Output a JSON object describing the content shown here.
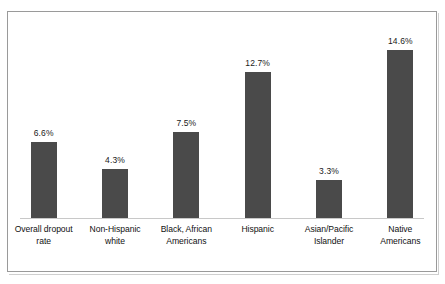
{
  "chart_data": {
    "type": "bar",
    "title": "",
    "subtitle": "",
    "xlabel": "",
    "ylabel": "",
    "categories": [
      "Overall dropout rate",
      "Non-Hispanic white",
      "Black, African Americans",
      "Hispanic",
      "Asian/Pacific Islander",
      "Native Americans"
    ],
    "values": [
      6.6,
      4.3,
      7.5,
      12.7,
      3.3,
      14.6
    ],
    "value_labels": [
      "6.6%",
      "4.3%",
      "7.5%",
      "12.7%",
      "3.3%",
      "14.6%"
    ],
    "ylim": [
      0,
      14.6
    ],
    "grid": false,
    "legend": null,
    "axis_visible": {
      "x_baseline": true,
      "y_axis": false,
      "y_ticks": false
    },
    "bar_color": "#4a4a4a",
    "background_color": "#ffffff",
    "frame_color": "#9a9a9a",
    "axis_line_color": "#c8c8c8",
    "text_color": "#111111"
  },
  "bars": [
    {
      "category": "Overall dropout rate",
      "label_lines": [
        "Overall dropout",
        "rate"
      ],
      "value": 6.6,
      "value_label": "6.6%"
    },
    {
      "category": "Non-Hispanic white",
      "label_lines": [
        "Non-Hispanic",
        "white"
      ],
      "value": 4.3,
      "value_label": "4.3%"
    },
    {
      "category": "Black, African Americans",
      "label_lines": [
        "Black, African",
        "Americans"
      ],
      "value": 7.5,
      "value_label": "7.5%"
    },
    {
      "category": "Hispanic",
      "label_lines": [
        "Hispanic",
        ""
      ],
      "value": 12.7,
      "value_label": "12.7%"
    },
    {
      "category": "Asian/Pacific Islander",
      "label_lines": [
        "Asian/Pacific",
        "Islander"
      ],
      "value": 3.3,
      "value_label": "3.3%"
    },
    {
      "category": "Native Americans",
      "label_lines": [
        "Native",
        "Americans"
      ],
      "value": 14.6,
      "value_label": "14.6%"
    }
  ]
}
